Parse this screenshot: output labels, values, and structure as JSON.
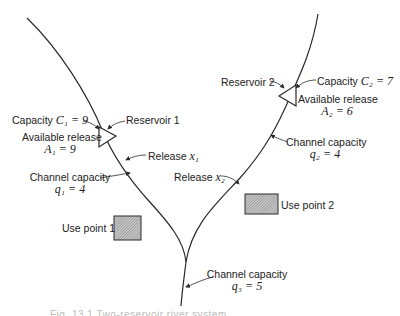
{
  "diagram": {
    "type": "river-reservoir-network",
    "reservoirs": [
      {
        "name": "Reservoir 1",
        "capacity_label": "Capacity",
        "capacity_symbol": "C₁ = 9",
        "available_label": "Available release",
        "available_symbol": "A₁ = 9",
        "release_label": "Release",
        "release_symbol": "x₁"
      },
      {
        "name": "Reservoir 2",
        "capacity_label": "Capacity",
        "capacity_symbol": "C₂ = 7",
        "available_label": "Available release",
        "available_symbol": "A₂ = 6",
        "release_label": "Release",
        "release_symbol": "x₂"
      }
    ],
    "channels": [
      {
        "label": "Channel capacity",
        "symbol": "q₁ = 4"
      },
      {
        "label": "Channel capacity",
        "symbol": "q₂ = 4"
      },
      {
        "label": "Channel capacity",
        "symbol": "q₃ = 5"
      }
    ],
    "use_points": [
      {
        "label": "Use point 1"
      },
      {
        "label": "Use point 2"
      }
    ],
    "caption": "Fig. 13.1  Two-reservoir river system"
  },
  "colors": {
    "line": "#2a2a2a",
    "hatch_fill": "#8a8a8a",
    "text": "#222222"
  }
}
